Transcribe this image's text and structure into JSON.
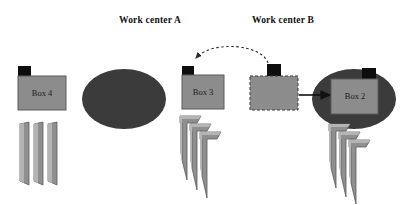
{
  "figure": {
    "background_color": "#ffffff",
    "type": "process-flow-diagram",
    "width": 418,
    "height": 205
  },
  "headers": [
    {
      "id": "work-center-a",
      "label": "Work center A",
      "x": 150,
      "y": 20
    },
    {
      "id": "work-center-b",
      "label": "Work center B",
      "x": 283,
      "y": 20
    }
  ],
  "colors": {
    "box_fill": "#8c8c8c",
    "box_stroke": "#5a5a5a",
    "tab_fill": "#0d0d0d",
    "ellipse_fill": "#3b3b3b",
    "blade_fill": "#8f8f8f",
    "blade_stroke": "#5a5a5a",
    "blade_highlight": "#b4b4b4",
    "arrow_solid": "#111111",
    "arrow_dashed": "#2a2a2a",
    "text": "#111111"
  },
  "boxes": [
    {
      "id": "box-4",
      "label": "Box 4",
      "x": 18,
      "y": 72,
      "width": 48,
      "height": 38,
      "tab_position": "top-left",
      "border_style": "solid",
      "on_machine": false
    },
    {
      "id": "box-3",
      "label": "Box 3",
      "x": 182,
      "y": 72,
      "width": 42,
      "height": 36,
      "tab_position": "top-left",
      "border_style": "solid",
      "on_machine": false
    },
    {
      "id": "box-in-transit",
      "label": "",
      "x": 250,
      "y": 73,
      "width": 48,
      "height": 37,
      "tab_position": "top-center",
      "border_style": "dashed",
      "on_machine": false
    },
    {
      "id": "box-2",
      "label": "Box 2",
      "x": 331,
      "y": 78,
      "width": 47,
      "height": 38,
      "tab_position": "top-right",
      "border_style": "solid",
      "on_machine": true
    }
  ],
  "machines": [
    {
      "id": "machine-a",
      "shape": "ellipse",
      "cx": 124,
      "cy": 99,
      "rx": 42,
      "ry": 30
    },
    {
      "id": "machine-b",
      "shape": "ellipse",
      "cx": 354,
      "cy": 99,
      "rx": 42,
      "ry": 30
    }
  ],
  "blade_groups": [
    {
      "id": "blades-box-4",
      "style": "straight",
      "count": 3,
      "x": 20,
      "y": 122
    },
    {
      "id": "blades-box-3",
      "style": "hooked",
      "count": 3,
      "x": 180,
      "y": 116
    },
    {
      "id": "blades-box-2",
      "style": "hooked",
      "count": 3,
      "x": 329,
      "y": 124
    }
  ],
  "arrows": [
    {
      "id": "arrow-return-dashed",
      "style": "dashed",
      "from": "box-in-transit-tab",
      "to": "box-3-tab",
      "direction": "right-to-left",
      "shape": "curved-arc"
    },
    {
      "id": "arrow-transfer-solid",
      "style": "solid",
      "from": "box-in-transit",
      "to": "box-2",
      "direction": "left-to-right",
      "shape": "straight"
    }
  ]
}
